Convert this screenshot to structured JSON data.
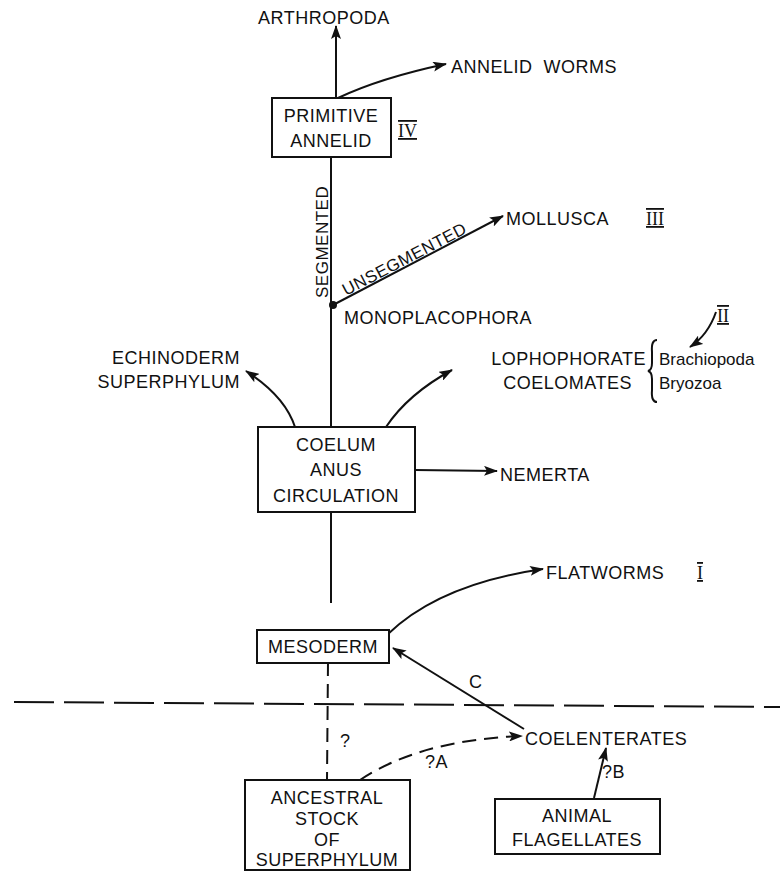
{
  "diagram": {
    "colors": {
      "ink": "#111111",
      "background": "#ffffff"
    },
    "nodes": {
      "arthropoda": "ARTHROPODA",
      "annelid_worms": "ANNELID  WORMS",
      "primitive_annelid": [
        "PRIMITIVE",
        "ANNELID"
      ],
      "mollusca": "MOLLUSCA",
      "monoplacophora": "MONOPLACOPHORA",
      "echinoderm_superphylum": [
        "ECHINODERM",
        "SUPERPHYLUM"
      ],
      "lophophorate_coelomates": [
        "LOPHOPHORATE",
        "COELOMATES"
      ],
      "lophophorate_members": [
        "Brachiopoda",
        "Bryozoa"
      ],
      "coelum_box": [
        "COELUM",
        "ANUS",
        "CIRCULATION"
      ],
      "nemerta": "NEMERTA",
      "flatworms": "FLATWORMS",
      "mesoderm": "MESODERM",
      "coelenterates": "COELENTERATES",
      "ancestral_stock": [
        "ANCESTRAL",
        "STOCK",
        "OF",
        "SUPERPHYLUM"
      ],
      "animal_flagellates": [
        "ANIMAL",
        "FLAGELLATES"
      ]
    },
    "edge_labels": {
      "segmented": "SEGMENTED",
      "unsegmented": "UNSEGMENTED",
      "c": "C",
      "q": "?",
      "qa": "?A",
      "qb": "?B"
    },
    "roman_numerals": {
      "primitive_annelid": "IV",
      "mollusca": "III",
      "lophophorates": "II",
      "flatworms": "I"
    }
  }
}
